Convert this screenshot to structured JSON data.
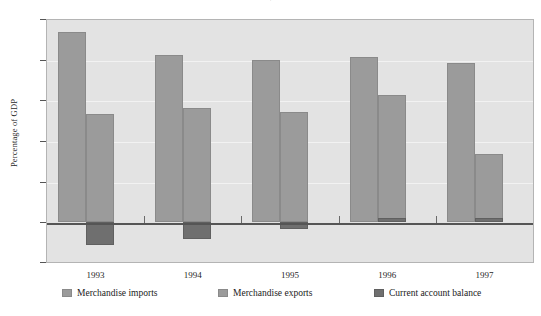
{
  "chart_data": {
    "type": "bar",
    "title": "",
    "xlabel": "",
    "ylabel": "Percentage of GDP",
    "categories": [
      "1993",
      "1994",
      "1995",
      "1996",
      "1997"
    ],
    "series": [
      {
        "name": "Merchandise imports",
        "key": "imports",
        "color": "#9b9b9b",
        "values": [
          47.0,
          41.3,
          40.1,
          40.8,
          39.4
        ]
      },
      {
        "name": "Merchandise exports",
        "key": "exports",
        "color": "#9b9b9b",
        "values": [
          26.7,
          28.2,
          27.3,
          31.5,
          16.9
        ]
      },
      {
        "name": "Current account balance",
        "key": "balance",
        "color": "#6f6f6f",
        "values": [
          -5.8,
          -4.2,
          -1.7,
          0.8,
          0.9
        ]
      }
    ],
    "ylim": [
      -10,
      50
    ],
    "yticks": [
      50,
      40,
      30,
      20,
      10,
      0,
      -10
    ],
    "ytick_labels": [
      "50",
      "40",
      "30",
      "20",
      "10",
      "0",
      "-10"
    ],
    "grid": true,
    "grid_axis": "y",
    "legend_position": "bottom",
    "plot_background": "#e3e3e3",
    "figure_background": "#ffffff"
  },
  "axis": {
    "y_title": "Percentage of GDP",
    "tick_50": "50",
    "tick_40": "40",
    "tick_30": "30",
    "tick_20": "20",
    "tick_10": "10",
    "tick_0": "0",
    "tick_m10": "-10"
  },
  "xlabels": {
    "y1993": "1993",
    "y1994": "1994",
    "y1995": "1995",
    "y1996": "1996",
    "y1997": "1997"
  },
  "legend": {
    "imports": "Merchandise imports",
    "exports": "Merchandise exports",
    "balance": "Current account balance"
  },
  "title_clipped": "."
}
